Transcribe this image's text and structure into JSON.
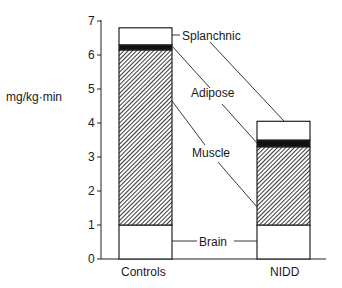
{
  "chart_data": {
    "type": "bar",
    "stacked": true,
    "title": "",
    "xlabel": "",
    "ylabel": "mg/kg·min",
    "ylim": [
      0,
      7
    ],
    "yticks": [
      "0",
      "1",
      "2",
      "3",
      "4",
      "5",
      "6",
      "7"
    ],
    "grid": false,
    "categories": [
      "Controls",
      "NIDD"
    ],
    "series": [
      {
        "name": "Brain",
        "values": [
          1.0,
          1.0
        ],
        "fill": "white"
      },
      {
        "name": "Muscle",
        "values": [
          5.15,
          2.3
        ],
        "fill": "hatched"
      },
      {
        "name": "Adipose",
        "values": [
          0.15,
          0.2
        ],
        "fill": "black"
      },
      {
        "name": "Splanchnic",
        "values": [
          0.5,
          0.55
        ],
        "fill": "white"
      }
    ],
    "totals": [
      6.8,
      4.05
    ],
    "legend": "inline leader-line labels between bars",
    "labels": {
      "brain": "Brain",
      "muscle": "Muscle",
      "adipose": "Adipose",
      "splanchnic": "Splanchnic"
    }
  }
}
